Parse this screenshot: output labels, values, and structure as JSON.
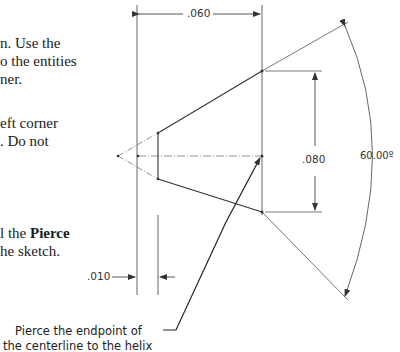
{
  "instructions": {
    "line1": "n. Use the",
    "line2": "o the entities",
    "line3": "ner.",
    "line4": "eft corner",
    "line5": ". Do not",
    "line6_prefix": "l the ",
    "line6_bold": "Pierce",
    "line7": "he sketch."
  },
  "drawing": {
    "dimensions": {
      "width_top": ".060",
      "height_right": ".080",
      "angle": "60.00º",
      "offset_bottom": ".010"
    },
    "callout": {
      "line1": "Pierce the endpoint of",
      "line2": "the centerline to the helix"
    }
  }
}
